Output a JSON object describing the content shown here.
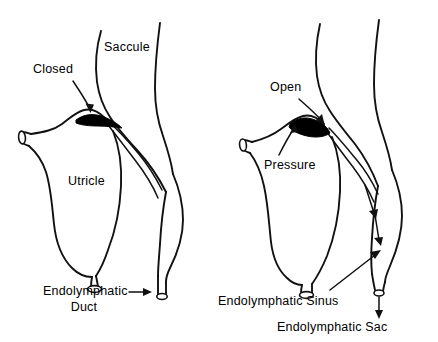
{
  "figure": {
    "background_color": "#ffffff",
    "line_color": "#111111",
    "valve_color": "#000000"
  },
  "panels": [
    {
      "id": "left-panel",
      "name": "closed-valve-panel",
      "state_label": "Closed",
      "labels": [
        {
          "name": "closed-label",
          "text": "Closed"
        },
        {
          "name": "saccule-label",
          "text": "Saccule"
        },
        {
          "name": "utricle-label",
          "text": "Utricle"
        },
        {
          "name": "endolymphatic-duct-label-line1",
          "text": "Endolymphatic"
        },
        {
          "name": "endolymphatic-duct-label-line2",
          "text": "Duct"
        }
      ]
    },
    {
      "id": "right-panel",
      "name": "open-valve-panel",
      "state_label": "Open",
      "labels": [
        {
          "name": "open-label",
          "text": "Open"
        },
        {
          "name": "pressure-label",
          "text": "Pressure"
        },
        {
          "name": "endolymphatic-sinus-label",
          "text": "Endolymphatic Sinus"
        },
        {
          "name": "endolymphatic-sac-label",
          "text": "Endolymphatic Sac"
        }
      ]
    }
  ],
  "text": {
    "closed": "Closed",
    "saccule": "Saccule",
    "utricle": "Utricle",
    "endolymphatic_duct_line1": "Endolymphatic",
    "endolymphatic_duct_line2": "Duct",
    "open": "Open",
    "pressure": "Pressure",
    "endolymphatic_sinus": "Endolymphatic Sinus",
    "endolymphatic_sac": "Endolymphatic Sac"
  }
}
